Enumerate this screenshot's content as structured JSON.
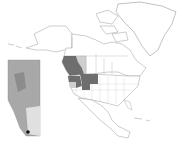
{
  "map": {
    "type": "range-map",
    "region": "North America",
    "colors": {
      "background": "#ffffff",
      "outline": "#9a9a9a",
      "range_primary": "#6e6e6e",
      "range_secondary": "#cfcfcf",
      "inset_fill": "#a8a8a8",
      "inset_light": "#e0e0e0",
      "locality_marker": "#111111"
    },
    "highlighted_regions": [
      {
        "name": "British Columbia",
        "shade": "primary"
      },
      {
        "name": "Washington",
        "shade": "primary"
      },
      {
        "name": "Idaho",
        "shade": "primary"
      },
      {
        "name": "Montana",
        "shade": "primary"
      },
      {
        "name": "Alberta",
        "shade": "secondary"
      },
      {
        "name": "Oregon",
        "shade": "secondary"
      },
      {
        "name": "Wyoming (part)",
        "shade": "primary"
      }
    ],
    "inset": {
      "name": "Alberta",
      "position": "left",
      "marker": "southwest corner locality"
    }
  }
}
